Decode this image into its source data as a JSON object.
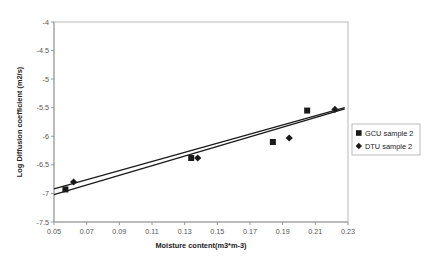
{
  "chart_data": {
    "type": "scatter",
    "title": "",
    "xlabel": "Moisture content(m3*m-3)",
    "ylabel": "Log Diffusion coefficient (m2/s)",
    "xlim": [
      0.05,
      0.23
    ],
    "ylim": [
      -7.5,
      -4.0
    ],
    "xticks": [
      "0.05",
      "0.07",
      "0.09",
      "0.11",
      "0.13",
      "0.15",
      "0.17",
      "0.19",
      "0.21",
      "0.23"
    ],
    "xtick_values": [
      0.05,
      0.07,
      0.09,
      0.11,
      0.13,
      0.15,
      0.17,
      0.19,
      0.21,
      0.23
    ],
    "yticks": [
      "-4",
      "-4.5",
      "-5",
      "-5.5",
      "-6",
      "-6.5",
      "-7",
      "-7.5"
    ],
    "ytick_values": [
      -4,
      -4.5,
      -5,
      -5.5,
      -6,
      -6.5,
      -7,
      -7.5
    ],
    "grid": false,
    "legend_position": "right",
    "series": [
      {
        "name": "GCU sample 2",
        "marker": "square",
        "color": "#1a1a1a",
        "x": [
          0.057,
          0.134,
          0.184,
          0.205
        ],
        "y": [
          -6.93,
          -6.38,
          -6.1,
          -5.55
        ],
        "trendline": {
          "x": [
            0.05,
            0.228
          ],
          "y": [
            -7.02,
            -5.52
          ]
        }
      },
      {
        "name": "DTU sample 2",
        "marker": "diamond",
        "color": "#1a1a1a",
        "x": [
          0.062,
          0.138,
          0.194,
          0.222
        ],
        "y": [
          -6.8,
          -6.38,
          -6.03,
          -5.53
        ],
        "trendline": {
          "x": [
            0.05,
            0.228
          ],
          "y": [
            -6.92,
            -5.5
          ]
        }
      }
    ]
  },
  "legend": {
    "entries": [
      {
        "label": "GCU sample 2",
        "marker": "square"
      },
      {
        "label": "DTU sample 2",
        "marker": "diamond"
      }
    ]
  }
}
